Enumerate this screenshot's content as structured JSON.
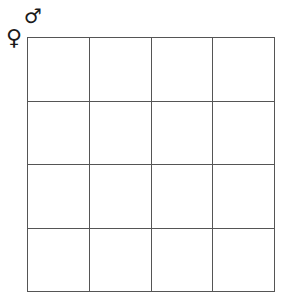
{
  "diagram": {
    "type": "punnett-square",
    "rows": 4,
    "cols": 4,
    "column_header_symbol": "♂",
    "row_header_symbol": "♀",
    "cells": [
      [
        "",
        "",
        "",
        ""
      ],
      [
        "",
        "",
        "",
        ""
      ],
      [
        "",
        "",
        "",
        ""
      ],
      [
        "",
        "",
        "",
        ""
      ]
    ]
  }
}
